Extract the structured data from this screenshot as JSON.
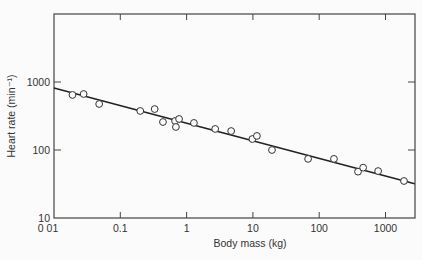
{
  "chart_data": {
    "type": "scatter",
    "title": "",
    "xlabel": "Body mass (kg)",
    "ylabel": "Heart rate (min⁻¹)",
    "xscale": "log",
    "yscale": "log",
    "xlim": [
      0.01,
      3000
    ],
    "ylim": [
      10,
      10000
    ],
    "x_ticks": [
      0.01,
      0.1,
      1,
      10,
      100,
      1000
    ],
    "x_tick_labels": [
      "0 01",
      "0.1",
      "1",
      "10",
      "100",
      "1000"
    ],
    "y_ticks": [
      10,
      100,
      1000
    ],
    "y_tick_labels": [
      "10",
      "100",
      "1000"
    ],
    "grid": false,
    "legend": null,
    "series": [
      {
        "name": "observations",
        "marker": "open-circle",
        "points": [
          {
            "x": 0.019,
            "y": 645
          },
          {
            "x": 0.028,
            "y": 666
          },
          {
            "x": 0.048,
            "y": 475
          },
          {
            "x": 0.2,
            "y": 375
          },
          {
            "x": 0.33,
            "y": 400
          },
          {
            "x": 0.44,
            "y": 258
          },
          {
            "x": 0.67,
            "y": 267
          },
          {
            "x": 0.69,
            "y": 218
          },
          {
            "x": 0.77,
            "y": 286
          },
          {
            "x": 1.29,
            "y": 250
          },
          {
            "x": 2.7,
            "y": 204
          },
          {
            "x": 4.7,
            "y": 190
          },
          {
            "x": 9.8,
            "y": 145
          },
          {
            "x": 11.5,
            "y": 161
          },
          {
            "x": 19.4,
            "y": 100
          },
          {
            "x": 68,
            "y": 74
          },
          {
            "x": 167,
            "y": 74
          },
          {
            "x": 385,
            "y": 48
          },
          {
            "x": 460,
            "y": 55
          },
          {
            "x": 774,
            "y": 49
          },
          {
            "x": 1900,
            "y": 35
          }
        ]
      },
      {
        "name": "regression line",
        "type": "line",
        "points": [
          {
            "x": 0.01,
            "y": 817
          },
          {
            "x": 2750,
            "y": 32
          }
        ]
      }
    ]
  }
}
